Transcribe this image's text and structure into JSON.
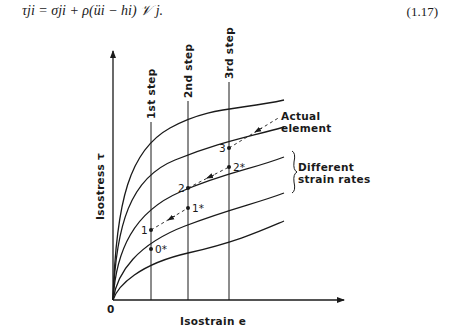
{
  "equation": {
    "text": "τji = σji + ρ(üi − hi) 𝒱 j.",
    "number": "(1.17)"
  },
  "diagram": {
    "y_axis_label": "Isostress τ",
    "x_axis_label": "Isostrain e",
    "origin_label": "0",
    "step_labels": [
      "1st step",
      "2nd step",
      "3rd step"
    ],
    "annotation_actual": [
      "Actual",
      "element"
    ],
    "annotation_rates": [
      "Different",
      "strain rates"
    ],
    "points": [
      {
        "label": "0*",
        "step": 1
      },
      {
        "label": "1",
        "step": 1
      },
      {
        "label": "1*",
        "step": 2
      },
      {
        "label": "2",
        "step": 2
      },
      {
        "label": "2*",
        "step": 3
      },
      {
        "label": "3",
        "step": 3
      }
    ],
    "curve_count": 5,
    "colors": {
      "ink": "#1a1a1a",
      "background": "#ffffff"
    }
  }
}
